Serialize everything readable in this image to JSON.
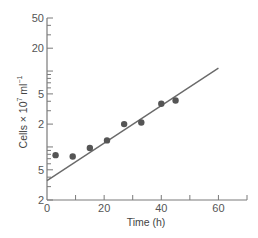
{
  "chart_data": {
    "type": "scatter",
    "title": "",
    "xlabel": "Time (h)",
    "ylabel": "Cells × 10⁷ ml⁻¹",
    "ylabel_parts": {
      "main": "Cells × 10",
      "sup1": "7",
      "mid": " ml",
      "sup2": "−1"
    },
    "xlim": [
      0,
      70
    ],
    "ylim": [
      0.2,
      50
    ],
    "yscale": "log",
    "grid": false,
    "legend": null,
    "x_ticks": [
      0,
      10,
      20,
      30,
      40,
      50,
      60,
      70
    ],
    "x_tick_labels": [
      {
        "value": 0,
        "label": "0"
      },
      {
        "value": 20,
        "label": "20"
      },
      {
        "value": 40,
        "label": "40"
      },
      {
        "value": 60,
        "label": "60"
      }
    ],
    "y_tick_labels": [
      {
        "value": 50,
        "label": "50"
      },
      {
        "value": 20,
        "label": "20"
      },
      {
        "value": 5,
        "label": "5"
      },
      {
        "value": 2,
        "label": "2"
      },
      {
        "value": 0.5,
        "label": "5"
      },
      {
        "value": 0.2,
        "label": "2"
      }
    ],
    "series": [
      {
        "name": "observed",
        "kind": "points",
        "x": [
          3,
          9,
          15,
          21,
          27,
          33,
          40,
          45
        ],
        "y": [
          0.78,
          0.75,
          0.97,
          1.22,
          2.0,
          2.1,
          3.7,
          4.1
        ]
      },
      {
        "name": "fit",
        "kind": "line",
        "x": [
          0,
          60
        ],
        "y": [
          0.36,
          10.9
        ]
      }
    ],
    "colors": {
      "axis": "#7a7a7a",
      "points": "#555555",
      "line": "#6a6a6a"
    }
  }
}
